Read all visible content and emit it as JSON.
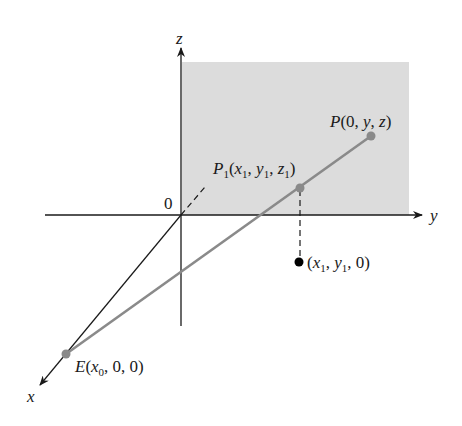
{
  "diagram": {
    "type": "3d-coordinate-projection",
    "axes": {
      "x": {
        "label": "x"
      },
      "y": {
        "label": "y"
      },
      "z": {
        "label": "z"
      },
      "origin": {
        "label": "0"
      }
    },
    "plane": {
      "description": "yz-plane (shaded)",
      "fill": "#dcdcdc"
    },
    "points": {
      "P": {
        "name": "P",
        "coords": "(0, y, z)"
      },
      "P1": {
        "name": "P",
        "subscript": "1",
        "coords_parts": [
          "(",
          "x",
          "1",
          ", ",
          "y",
          "1",
          ", ",
          "z",
          "1",
          ")"
        ]
      },
      "E": {
        "name": "E",
        "coords_parts": [
          "(",
          "x",
          "0",
          ", 0, 0)"
        ]
      },
      "projection": {
        "coords_parts": [
          "(",
          "x",
          "1",
          ", ",
          "y",
          "1",
          ", 0)"
        ]
      }
    },
    "colors": {
      "axis": "#1a1a1a",
      "ray": "#8a8a8a",
      "point_gray": "#8a8a8a",
      "point_black": "#000000"
    }
  }
}
